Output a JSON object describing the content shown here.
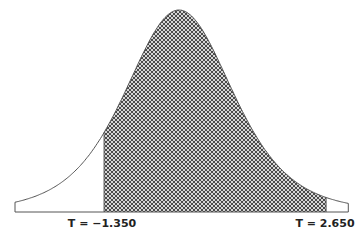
{
  "chart_data": {
    "type": "area",
    "title": "",
    "distribution": "Student t",
    "degrees_of_freedom_estimate": 5,
    "xlabel": "",
    "ylabel": "",
    "x_range": [
      -2.955,
      3.05
    ],
    "shaded_region": {
      "from": -1.35,
      "to": 2.65,
      "fill": "crosshatch"
    },
    "annotations": [
      {
        "text": "T = −1.350",
        "x": -1.35,
        "position": "below-axis"
      },
      {
        "text": "T = 2.650",
        "x": 2.65,
        "position": "below-axis"
      }
    ],
    "grid": false,
    "legend": null
  },
  "labels": {
    "left": "T = −1.350",
    "right": "T = 2.650"
  },
  "colors": {
    "outline": "#555555",
    "hatch": "#444444",
    "hatch_bg": "#d9d9d9"
  }
}
